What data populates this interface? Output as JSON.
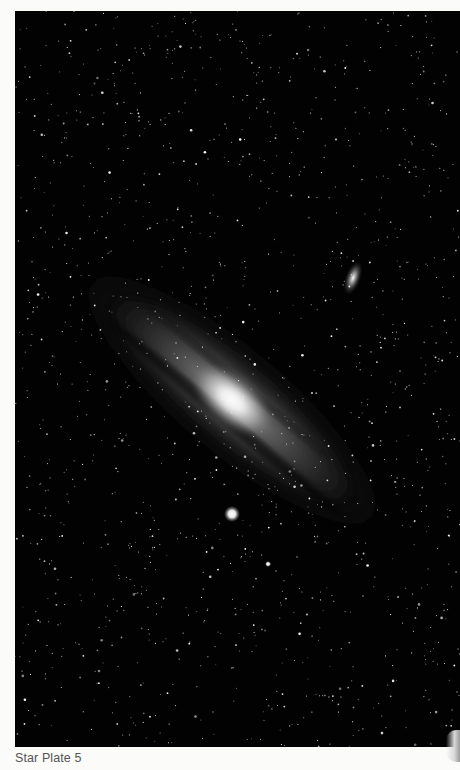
{
  "figure": {
    "caption": "Star Plate 5",
    "background_color": "#020202",
    "page_color": "#fbfbfa",
    "caption_color": "#555555",
    "elements": {
      "main_galaxy": {
        "center": [
          232,
          400
        ],
        "tilt_deg": 40,
        "core_color": "#f4f4f4"
      },
      "satellite_upper": {
        "center": [
          353,
          278
        ]
      },
      "satellite_lower_bright": {
        "center": [
          232,
          514
        ]
      },
      "small_star_lower": {
        "center": [
          268,
          564
        ]
      }
    }
  }
}
